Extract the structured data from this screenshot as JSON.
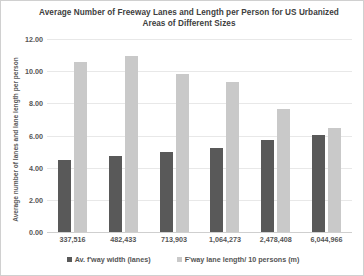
{
  "chart_data": {
    "type": "bar",
    "title": "Average Number of Freeway Lanes and Length per Person for US Urbanized Areas of Different Sizes",
    "xlabel": "",
    "ylabel": "Average number of lanes and lane length per person",
    "ylim": [
      0,
      12
    ],
    "ytick_step": 2,
    "yticks": [
      "0.00",
      "2.00",
      "4.00",
      "6.00",
      "8.00",
      "10.00",
      "12.00"
    ],
    "ytick_values": [
      0,
      2,
      4,
      6,
      8,
      10,
      12
    ],
    "grid": true,
    "legend_position": "bottom",
    "categories": [
      "337,516",
      "482,433",
      "713,903",
      "1,064,273",
      "2,478,408",
      "6,044,966"
    ],
    "series": [
      {
        "name": "Av. f'way width (lanes)",
        "color": "#595959",
        "values": [
          4.5,
          4.75,
          4.95,
          5.2,
          5.75,
          6.05
        ]
      },
      {
        "name": "F'way lane length/ 10 persons (m)",
        "color": "#c9c9c9",
        "values": [
          10.6,
          10.95,
          9.85,
          9.35,
          7.65,
          6.45
        ]
      }
    ]
  }
}
